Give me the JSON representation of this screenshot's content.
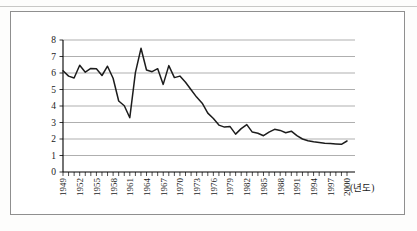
{
  "figure": {
    "kind": "scanned-document-line-chart",
    "x_axis_unit_label": "(년도)",
    "frame_border_color": "#8f8f8f",
    "line_color": "#1c1c1c",
    "grid_color": "#8c8c8c",
    "axis_color": "#000000",
    "text_color": "#1a1a1a"
  },
  "chart_data": {
    "type": "line",
    "title": "",
    "xlabel": "(년도)",
    "ylabel": "",
    "ylim": [
      0,
      8
    ],
    "yticks": [
      0,
      1,
      2,
      3,
      4,
      5,
      6,
      7,
      8
    ],
    "xtick_years": [
      1949,
      1952,
      1955,
      1958,
      1961,
      1964,
      1967,
      1970,
      1973,
      1976,
      1979,
      1982,
      1985,
      1988,
      1991,
      1994,
      1997,
      2000
    ],
    "grid": "horizontal",
    "legend": "none",
    "x": [
      1949,
      1950,
      1951,
      1952,
      1953,
      1954,
      1955,
      1956,
      1957,
      1958,
      1959,
      1960,
      1961,
      1962,
      1963,
      1964,
      1965,
      1966,
      1967,
      1968,
      1969,
      1970,
      1971,
      1972,
      1973,
      1974,
      1975,
      1976,
      1977,
      1978,
      1979,
      1980,
      1981,
      1982,
      1983,
      1984,
      1985,
      1986,
      1987,
      1988,
      1989,
      1990,
      1991,
      1992,
      1993,
      1994,
      1995,
      1996,
      1997,
      1998,
      1999,
      2000
    ],
    "values": [
      6.14,
      5.81,
      5.7,
      6.47,
      6.05,
      6.28,
      6.26,
      5.85,
      6.41,
      5.68,
      4.3,
      4.02,
      3.29,
      6.02,
      7.5,
      6.18,
      6.08,
      6.26,
      5.31,
      6.45,
      5.72,
      5.81,
      5.44,
      4.98,
      4.54,
      4.17,
      3.57,
      3.24,
      2.84,
      2.72,
      2.75,
      2.3,
      2.63,
      2.87,
      2.42,
      2.35,
      2.2,
      2.42,
      2.59,
      2.52,
      2.38,
      2.47,
      2.2,
      2.0,
      1.9,
      1.83,
      1.78,
      1.74,
      1.72,
      1.7,
      1.68,
      1.88
    ]
  }
}
